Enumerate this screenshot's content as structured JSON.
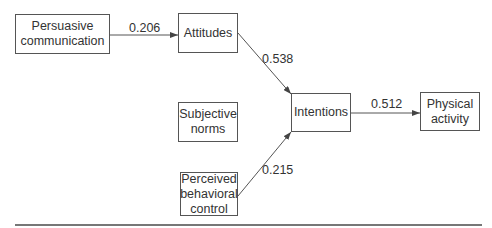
{
  "nodes": {
    "persuasive": "Persuasive\ncommunication",
    "attitudes": "Attitudes",
    "subjective": "Subjective\nnorms",
    "perceived": "Perceived\nbehavioral\ncontrol",
    "intentions": "Intentions",
    "physical": "Physical\nactivity"
  },
  "paths": {
    "persuasive_to_attitudes": "0.206",
    "attitudes_to_intentions": "0.538",
    "perceived_to_intentions": "0.215",
    "intentions_to_physical": "0.512"
  },
  "colors": {
    "line": "#555555",
    "text": "#333333"
  }
}
